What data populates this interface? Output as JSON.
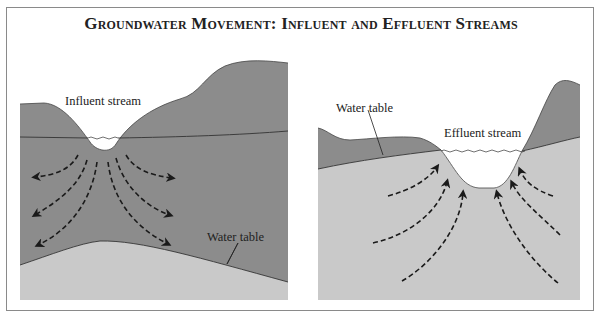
{
  "title": "Groundwater Movement: Influent and Effluent Streams",
  "colors": {
    "unsaturated_zone": "#8c8c8c",
    "saturated_zone": "#c9c9c9",
    "stream": "#ffffff",
    "line": "#333333",
    "frame": "#8a8a8a"
  },
  "panels": [
    {
      "id": "influent",
      "stream_label": "Influent stream",
      "water_table_label": "Water table",
      "flow_direction": "away from stream"
    },
    {
      "id": "effluent",
      "stream_label": "Effluent stream",
      "water_table_label": "Water table",
      "flow_direction": "toward stream"
    }
  ]
}
